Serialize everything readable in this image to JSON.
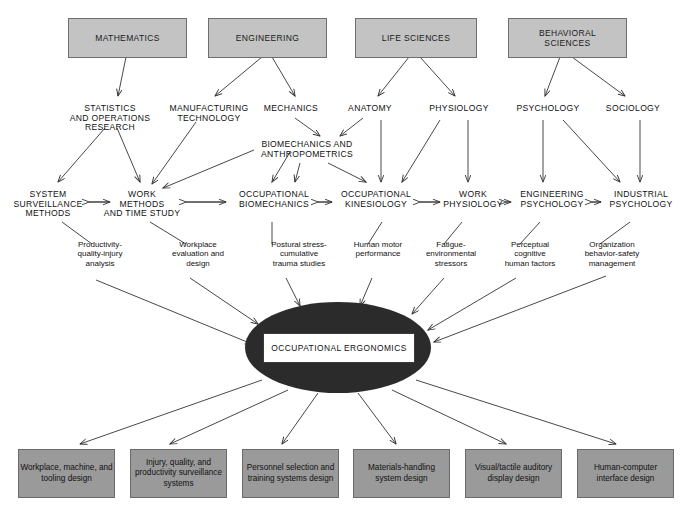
{
  "diagram": {
    "core": {
      "label": "OCCUPATIONAL ERGONOMICS"
    },
    "colors": {
      "source_box_fill": "#c3c3c3",
      "source_box_border": "#6e6e6e",
      "output_box_fill": "#9a9a9a",
      "output_box_border": "#6a6a6a",
      "core_ellipse_fill": "#2b2b2b",
      "core_label_fill": "#ffffff",
      "line": "#333333",
      "background": "#ffffff"
    },
    "source_boxes": [
      {
        "label": "MATHEMATICS",
        "x": 68,
        "y": 18,
        "w": 117,
        "h": 38
      },
      {
        "label": "ENGINEERING",
        "x": 208,
        "y": 18,
        "w": 117,
        "h": 38
      },
      {
        "label": "LIFE SCIENCES",
        "x": 355,
        "y": 18,
        "w": 120,
        "h": 38
      },
      {
        "label": "BEHAVIORAL\nSCIENCES",
        "x": 508,
        "y": 18,
        "w": 117,
        "h": 38
      }
    ],
    "sub_disciplines": [
      {
        "label": "STATISTICS\nAND OPERATIONS\nRESEARCH",
        "x": 62,
        "y": 104,
        "w": 96
      },
      {
        "label": "MANUFACTURING\nTECHNOLOGY",
        "x": 163,
        "y": 104,
        "w": 92
      },
      {
        "label": "MECHANICS",
        "x": 258,
        "y": 104,
        "w": 66
      },
      {
        "label": "ANATOMY",
        "x": 340,
        "y": 104,
        "w": 60
      },
      {
        "label": "PHYSIOLOGY",
        "x": 424,
        "y": 104,
        "w": 70
      },
      {
        "label": "PSYCHOLOGY",
        "x": 512,
        "y": 104,
        "w": 72
      },
      {
        "label": "SOCIOLOGY",
        "x": 600,
        "y": 104,
        "w": 66
      },
      {
        "label": "BIOMECHANICS AND\nANTHROPOMETRICS",
        "x": 252,
        "y": 140,
        "w": 110
      }
    ],
    "core_disciplines": [
      {
        "label": "SYSTEM\nSURVEILLANCE\nMETHODS",
        "x": 8,
        "y": 190,
        "w": 78
      },
      {
        "label": "WORK\nMETHODS\nAND TIME STUDY",
        "x": 96,
        "y": 190,
        "w": 86
      },
      {
        "label": "OCCUPATIONAL\nBIOMECHANICS",
        "x": 232,
        "y": 190,
        "w": 82
      },
      {
        "label": "OCCUPATIONAL\nKINESIOLOGY",
        "x": 336,
        "y": 190,
        "w": 80
      },
      {
        "label": "WORK\nPHYSIOLOGY",
        "x": 443,
        "y": 190,
        "w": 60
      },
      {
        "label": "ENGINEERING\nPSYCHOLOGY",
        "x": 512,
        "y": 190,
        "w": 76
      },
      {
        "label": "INDUSTRIAL\nPSYCHOLOGY",
        "x": 604,
        "y": 190,
        "w": 74
      }
    ],
    "topics": [
      {
        "label": "Productivity-\nquality-injury\nanalysis",
        "x": 62,
        "y": 240,
        "w": 76
      },
      {
        "label": "Workplace\nevaluation and\ndesign",
        "x": 159,
        "y": 240,
        "w": 78
      },
      {
        "label": "Postural stress-\ncumulative\ntrauma studies",
        "x": 259,
        "y": 240,
        "w": 82
      },
      {
        "label": "Human motor\nperformance",
        "x": 344,
        "y": 240,
        "w": 70
      },
      {
        "label": "Fatigue-\nenvironmental\nstressors",
        "x": 414,
        "y": 240,
        "w": 76
      },
      {
        "label": "Perceptual\ncognitive\nhuman factors",
        "x": 490,
        "y": 240,
        "w": 80
      },
      {
        "label": "Organization\nbehavior-safety\nmanagement",
        "x": 570,
        "y": 240,
        "w": 84
      }
    ],
    "output_boxes": [
      {
        "label": "Workplace,\nmachine, and\ntooling design",
        "x": 18,
        "y": 449,
        "w": 95,
        "h": 47
      },
      {
        "label": "Injury, quality,\nand productivity\nsurveillance\nsystems",
        "x": 130,
        "y": 449,
        "w": 95,
        "h": 47
      },
      {
        "label": "Personnel\nselection and\ntraining\nsystems design",
        "x": 242,
        "y": 449,
        "w": 95,
        "h": 47
      },
      {
        "label": "Materials-handling\nsystem design",
        "x": 353,
        "y": 449,
        "w": 95,
        "h": 47
      },
      {
        "label": "Visual/tactile\nauditory\ndisplay design",
        "x": 465,
        "y": 449,
        "w": 95,
        "h": 47
      },
      {
        "label": "Human-computer\ninterface design",
        "x": 577,
        "y": 449,
        "w": 95,
        "h": 47
      }
    ],
    "edges": {
      "source_to_sub": [
        {
          "from": "MATHEMATICS",
          "to": "STATISTICS AND OPERATIONS RESEARCH"
        },
        {
          "from": "ENGINEERING",
          "to": "MANUFACTURING TECHNOLOGY"
        },
        {
          "from": "ENGINEERING",
          "to": "MECHANICS"
        },
        {
          "from": "LIFE SCIENCES",
          "to": "ANATOMY"
        },
        {
          "from": "LIFE SCIENCES",
          "to": "PHYSIOLOGY"
        },
        {
          "from": "BEHAVIORAL SCIENCES",
          "to": "PSYCHOLOGY"
        },
        {
          "from": "BEHAVIORAL SCIENCES",
          "to": "SOCIOLOGY"
        }
      ],
      "sub_to_core": [
        {
          "from": "STATISTICS AND OPERATIONS RESEARCH",
          "to": "SYSTEM SURVEILLANCE METHODS"
        },
        {
          "from": "STATISTICS AND OPERATIONS RESEARCH",
          "to": "WORK METHODS AND TIME STUDY"
        },
        {
          "from": "MANUFACTURING TECHNOLOGY",
          "to": "WORK METHODS AND TIME STUDY"
        },
        {
          "from": "MECHANICS",
          "to": "BIOMECHANICS AND ANTHROPOMETRICS"
        },
        {
          "from": "ANATOMY",
          "to": "BIOMECHANICS AND ANTHROPOMETRICS"
        },
        {
          "from": "BIOMECHANICS AND ANTHROPOMETRICS",
          "to": "WORK METHODS AND TIME STUDY"
        },
        {
          "from": "BIOMECHANICS AND ANTHROPOMETRICS",
          "to": "OCCUPATIONAL BIOMECHANICS"
        },
        {
          "from": "BIOMECHANICS AND ANTHROPOMETRICS",
          "to": "OCCUPATIONAL KINESIOLOGY"
        },
        {
          "from": "ANATOMY",
          "to": "OCCUPATIONAL KINESIOLOGY"
        },
        {
          "from": "PHYSIOLOGY",
          "to": "OCCUPATIONAL KINESIOLOGY"
        },
        {
          "from": "PHYSIOLOGY",
          "to": "WORK PHYSIOLOGY"
        },
        {
          "from": "PSYCHOLOGY",
          "to": "ENGINEERING PSYCHOLOGY"
        },
        {
          "from": "PSYCHOLOGY",
          "to": "INDUSTRIAL PSYCHOLOGY"
        },
        {
          "from": "SOCIOLOGY",
          "to": "INDUSTRIAL PSYCHOLOGY"
        }
      ],
      "bidirectional_core_chain": [
        "SYSTEM SURVEILLANCE METHODS",
        "WORK METHODS AND TIME STUDY",
        "OCCUPATIONAL BIOMECHANICS",
        "OCCUPATIONAL KINESIOLOGY",
        "WORK PHYSIOLOGY",
        "ENGINEERING PSYCHOLOGY",
        "INDUSTRIAL PSYCHOLOGY"
      ],
      "topics_to_core_ellipse": 7,
      "core_ellipse_to_outputs": 6
    }
  }
}
